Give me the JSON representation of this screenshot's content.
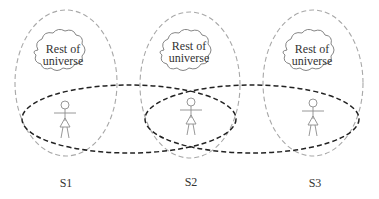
{
  "diagram": {
    "colors": {
      "system_boundary": "#a8a8a8",
      "interaction_boundary": "#222222",
      "figure": "#8c8c8c",
      "text": "#333333"
    },
    "systems": [
      {
        "label": "S1",
        "cloud_line1": "Rest of",
        "cloud_line2": "universe"
      },
      {
        "label": "S2",
        "cloud_line1": "Rest of",
        "cloud_line2": "universe"
      },
      {
        "label": "S3",
        "cloud_line1": "Rest of",
        "cloud_line2": "universe"
      }
    ]
  }
}
